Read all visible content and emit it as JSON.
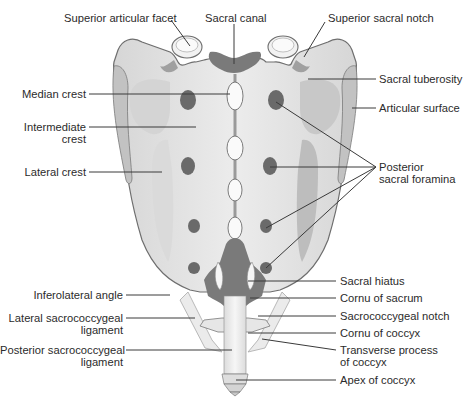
{
  "diagram": {
    "labels": {
      "superior_articular_facet": "Superior articular facet",
      "sacral_canal": "Sacral canal",
      "superior_sacral_notch": "Superior sacral notch",
      "sacral_tuberosity": "Sacral tuberosity",
      "articular_surface": "Articular surface",
      "median_crest": "Median crest",
      "intermediate_crest_1": "Intermediate",
      "intermediate_crest_2": "crest",
      "lateral_crest": "Lateral crest",
      "posterior_sacral_foramina_1": "Posterior",
      "posterior_sacral_foramina_2": "sacral foramina",
      "inferolateral_angle": "Inferolateral angle",
      "lateral_sacrococcygeal_ligament_1": "Lateral sacrococcygeal",
      "lateral_sacrococcygeal_ligament_2": "ligament",
      "posterior_sacrococcygeal_ligament_1": "Posterior sacrococcygeal",
      "posterior_sacrococcygeal_ligament_2": "ligament",
      "sacral_hiatus": "Sacral hiatus",
      "cornu_of_sacrum": "Cornu of sacrum",
      "sacrococcygeal_notch": "Sacrococcygeal notch",
      "cornu_of_coccyx": "Cornu of coccyx",
      "transverse_process_of_coccyx_1": "Transverse process",
      "transverse_process_of_coccyx_2": "of coccyx",
      "apex_of_coccyx": "Apex of coccyx"
    },
    "colors": {
      "bone": "#e4e4e4",
      "bone_light": "#f0f0f0",
      "bone_shadow": "#b8b8b8",
      "outline": "#6e6e6e",
      "cavity": "#7a7a7a",
      "foramen": "#6a6a6a",
      "leader": "#3a3a3a",
      "text": "#2b2b2b"
    }
  }
}
